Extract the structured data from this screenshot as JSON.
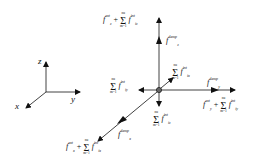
{
  "diagram": {
    "type": "force-vector-diagram",
    "coordinate_frame": {
      "axes": [
        {
          "name": "z",
          "label": "z"
        },
        {
          "name": "y",
          "label": "y"
        },
        {
          "name": "x",
          "label": "x"
        }
      ]
    },
    "center_node": {
      "label": "particle"
    },
    "vectors": [
      {
        "direction": "+z",
        "labels": {
          "near": "f_z^damp",
          "far": "f_z^ext + Σ_{m=1}^{nu} f_{iz}^int"
        }
      },
      {
        "direction": "+y",
        "labels": {
          "near": "f_y^damp",
          "far": "f_y^ext + Σ_{m=1}^{nu} f_{iy}^int"
        }
      },
      {
        "direction": "+x",
        "labels": {
          "near": "f_x^damp",
          "far": "f_x^ext + Σ_{m=1}^{nu} f_{ix}^int"
        }
      },
      {
        "direction": "-y",
        "labels": {
          "near": "Σ_{m=1}^{nu} f_{iy}^int"
        }
      },
      {
        "direction": "-z",
        "labels": {
          "near": "Σ_{m=1}^{nu} f_{iz}^int"
        }
      },
      {
        "direction": "-x",
        "labels": {
          "near": "Σ_{m=1}^{nu} f_{ix}^int"
        }
      }
    ],
    "text": {
      "f": "f",
      "plus": "+",
      "sigma": "Σ",
      "sum_top": "nu",
      "sum_bottom": "m=1",
      "ext": "ext",
      "int": "int",
      "damp": "damp",
      "sub_x": "x",
      "sub_y": "y",
      "sub_z": "z",
      "sub_ix": "ix",
      "sub_iy": "iy",
      "sub_iz": "iz",
      "axis_x": "x",
      "axis_y": "y",
      "axis_z": "z"
    }
  }
}
